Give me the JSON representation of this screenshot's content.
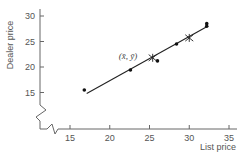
{
  "chart_data": {
    "type": "scatter",
    "title": "",
    "xlabel": "List price",
    "ylabel": "Dealer price",
    "xlim": [
      10.7,
      36
    ],
    "ylim": [
      7,
      32
    ],
    "x_ticks": [
      15,
      20,
      25,
      30,
      35
    ],
    "y_ticks": [
      15,
      20,
      25,
      30
    ],
    "grid": false,
    "legend": null,
    "axis_breaks": {
      "x": true,
      "y": true
    },
    "points": [
      {
        "x": 16.8,
        "y": 15.5
      },
      {
        "x": 22.6,
        "y": 19.4
      },
      {
        "x": 26.0,
        "y": 21.2
      },
      {
        "x": 28.4,
        "y": 24.5
      },
      {
        "x": 32.2,
        "y": 28.5
      },
      {
        "x": 32.2,
        "y": 28.0
      }
    ],
    "regression_line": {
      "x0": 17.1,
      "y0": 14.8,
      "x1": 32.2,
      "y1": 27.9
    },
    "markers": [
      {
        "x": 25.4,
        "y": 21.8,
        "symbol": "star",
        "label": "(x̄, ȳ)"
      },
      {
        "x": 30.0,
        "y": 25.7,
        "symbol": "star",
        "label": ""
      }
    ],
    "annotations": [
      {
        "text": "(x̄, ȳ)",
        "x": 25.4,
        "y": 21.8
      }
    ]
  },
  "colors": {
    "axis": "#666666",
    "line": "#222222",
    "points": "#111111",
    "text": "#555555"
  }
}
